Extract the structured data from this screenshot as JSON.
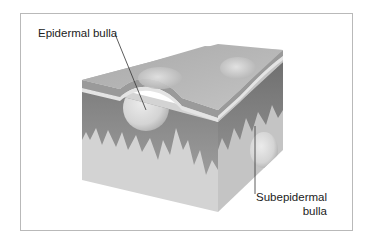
{
  "figure": {
    "type": "skin cross-section block diagram",
    "labels": {
      "epidermal": "Epidermal bulla",
      "subepidermal_line1": "Subepidermal",
      "subepidermal_line2": "bulla"
    }
  },
  "colors": {
    "frame_border": "#b9b9b9",
    "top_face": "#b5b5b5",
    "stratum_band": "#9a9a9a",
    "basement_line": "#e2e2e2",
    "epidermis": "#8c8c8c",
    "dermis": "#d2d2d2",
    "right_face_dermis": "#c6c6c6",
    "bulla_fill": "#dadada",
    "leader_line": "#333333",
    "text": "#222222"
  }
}
